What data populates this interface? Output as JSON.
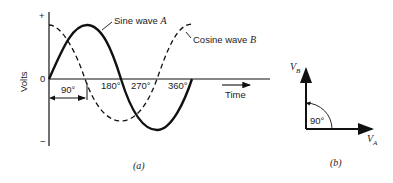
{
  "figure_a": {
    "caption": "(a)",
    "y_axis_label": "Volts",
    "y_plus": "+",
    "y_minus": "−",
    "origin": "0",
    "x_label": "Time",
    "ticks": [
      "180°",
      "270°",
      "360°"
    ],
    "offset_label": "90°",
    "sine_label_text": "Sine wave ",
    "sine_label_var": "A",
    "cosine_label_text": "Cosine wave ",
    "cosine_label_var": "B"
  },
  "figure_b": {
    "caption": "(b)",
    "vb": "V",
    "vb_sub": "B",
    "va": "V",
    "va_sub": "A",
    "angle": "90°"
  }
}
